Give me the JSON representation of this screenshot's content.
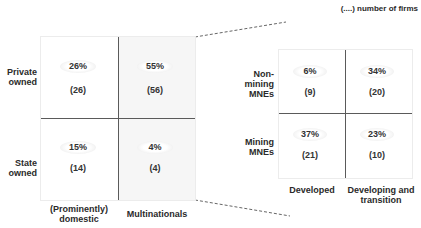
{
  "note": "(....) number of firms",
  "left_matrix": {
    "row_labels": [
      {
        "line1": "Private",
        "line2": "owned"
      },
      {
        "line1": "State",
        "line2": "owned"
      }
    ],
    "col_labels": [
      {
        "line1": "(Prominently)",
        "line2": "domestic"
      },
      {
        "line1": "Multinationals",
        "line2": ""
      }
    ],
    "cells": [
      {
        "row": "Private owned",
        "col": "(Prominently) domestic",
        "pct": "26%",
        "count": "(26)"
      },
      {
        "row": "Private owned",
        "col": "Multinationals",
        "pct": "55%",
        "count": "(56)"
      },
      {
        "row": "State owned",
        "col": "(Prominently) domestic",
        "pct": "15%",
        "count": "(14)"
      },
      {
        "row": "State owned",
        "col": "Multinationals",
        "pct": "4%",
        "count": "(4)"
      }
    ]
  },
  "right_matrix": {
    "row_labels": [
      {
        "line1": "Non-",
        "line2": "mining",
        "line3": "MNEs"
      },
      {
        "line1": "Mining",
        "line2": "MNEs",
        "line3": ""
      }
    ],
    "col_labels": [
      {
        "line1": "Developed",
        "line2": ""
      },
      {
        "line1": "Developing and",
        "line2": "transition"
      }
    ],
    "cells": [
      {
        "row": "Non-mining MNEs",
        "col": "Developed",
        "pct": "6%",
        "count": "(9)"
      },
      {
        "row": "Non-mining MNEs",
        "col": "Developing and transition",
        "pct": "34%",
        "count": "(20)"
      },
      {
        "row": "Mining MNEs",
        "col": "Developed",
        "pct": "37%",
        "count": "(21)"
      },
      {
        "row": "Mining MNEs",
        "col": "Developing and transition",
        "pct": "23%",
        "count": "(10)"
      }
    ]
  },
  "colors": {
    "divider": "#5a5a5a",
    "shaded_cell": "#f6f6f6",
    "text": "#2a2a2a"
  }
}
